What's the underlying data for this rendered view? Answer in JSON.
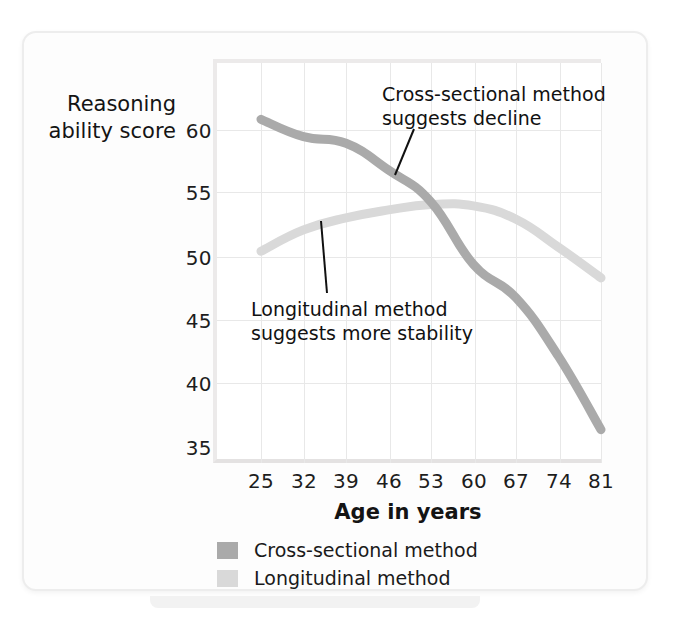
{
  "figure": {
    "y_axis_title": "Reasoning\nability score",
    "x_axis_title": "Age in years"
  },
  "annotations": {
    "cross_sectional": "Cross-sectional method\nsuggests decline",
    "longitudinal": "Longitudinal method\nsuggests more stability"
  },
  "legend": {
    "items": [
      {
        "label": "Cross-sectional method",
        "color": "#aaaaaa"
      },
      {
        "label": "Longitudinal method",
        "color": "#d9d9d9"
      }
    ]
  },
  "chart_data": {
    "type": "line",
    "title": "",
    "xlabel": "Age in years",
    "ylabel": "Reasoning ability score",
    "x": [
      25,
      32,
      39,
      46,
      53,
      60,
      67,
      74,
      81
    ],
    "xticklabels": [
      "25",
      "32",
      "39",
      "46",
      "53",
      "60",
      "67",
      "74",
      "81"
    ],
    "yticklabels": [
      "35",
      "40",
      "45",
      "50",
      "55",
      "60"
    ],
    "ylim": [
      35,
      65
    ],
    "yticks": [
      35,
      40,
      45,
      50,
      55,
      60
    ],
    "xlim": [
      21.5,
      81
    ],
    "grid": true,
    "legend_position": "below-axis-left",
    "series": [
      {
        "name": "Cross-sectional method",
        "color": "#aaaaaa",
        "values": [
          60.8,
          59.5,
          59.0,
          57.0,
          54.6,
          49.9,
          47.4,
          43.0,
          37.5
        ]
      },
      {
        "name": "Longitudinal method",
        "color": "#d9d9d9",
        "values": [
          50.9,
          52.5,
          53.4,
          54.0,
          54.4,
          54.3,
          53.3,
          51.2,
          48.9
        ]
      }
    ],
    "annotations": [
      {
        "text": "Cross-sectional method suggests decline",
        "points_to_series": "Cross-sectional method",
        "points_to_x": 47
      },
      {
        "text": "Longitudinal method suggests more stability",
        "points_to_series": "Longitudinal method",
        "points_to_x": 36
      }
    ]
  }
}
